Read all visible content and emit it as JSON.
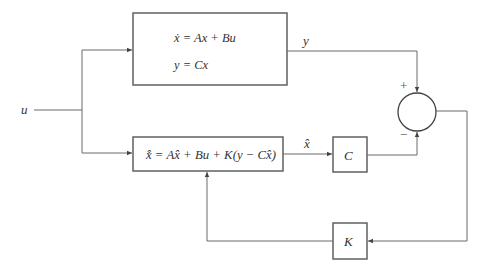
{
  "diagram": {
    "type": "block-diagram",
    "title": "",
    "input": {
      "label": "u"
    },
    "plant": {
      "eq1": "ẋ = Ax + Bu",
      "eq2": "y = Cx",
      "output_label": "y"
    },
    "observer": {
      "equation": "x̂̇ = Ax̂ + Bu + K(y − Cx̂)",
      "output_label": "x̂"
    },
    "c_block": {
      "label": "C"
    },
    "k_block": {
      "label": "K"
    },
    "summer": {
      "plus": "+",
      "minus": "−"
    },
    "colors": {
      "line": "#6b6b6b",
      "box": "#555555",
      "text": "#333333"
    }
  }
}
